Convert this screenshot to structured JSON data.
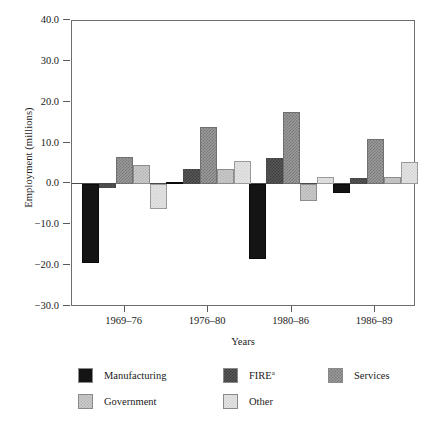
{
  "chart_data": {
    "type": "bar",
    "title": "",
    "xlabel": "Years",
    "ylabel": "Employment (millions)",
    "categories": [
      "1969–76",
      "1976–80",
      "1980–86",
      "1986–89"
    ],
    "ylim": [
      -30.0,
      40.0
    ],
    "yticks": [
      40.0,
      30.0,
      20.0,
      10.0,
      0.0,
      -10.0,
      -20.0,
      -30.0
    ],
    "ytick_labels": [
      "40.0",
      "30.0",
      "20.0",
      "10.0",
      "0.0",
      "−10.0",
      "−20.0",
      "−30.0"
    ],
    "grid": false,
    "legend_position": "below",
    "series": [
      {
        "name": "Manufacturing",
        "key": "manufacturing",
        "color": "#141414",
        "values": [
          -19.2,
          0.5,
          -18.2,
          -2.2
        ]
      },
      {
        "name": "FIRE",
        "key": "fire",
        "color": "#585858",
        "footnote": "a",
        "values": [
          -0.8,
          3.8,
          6.4,
          1.5
        ]
      },
      {
        "name": "Services",
        "key": "services",
        "color": "#9a9a9a",
        "values": [
          6.8,
          14.0,
          17.8,
          11.2
        ]
      },
      {
        "name": "Government",
        "key": "government",
        "color": "#cacaca",
        "values": [
          4.8,
          3.8,
          -4.1,
          1.9
        ]
      },
      {
        "name": "Other",
        "key": "other",
        "color": "#e4e4e4",
        "values": [
          -6.1,
          5.8,
          1.9,
          5.4
        ]
      }
    ]
  },
  "legend": {
    "rows": [
      [
        {
          "label": "Manufacturing",
          "key": "manufacturing",
          "sup": ""
        },
        {
          "label": "FIRE",
          "key": "fire",
          "sup": "a"
        },
        {
          "label": "Services",
          "key": "services",
          "sup": ""
        }
      ],
      [
        {
          "label": "Government",
          "key": "government",
          "sup": ""
        },
        {
          "label": "Other",
          "key": "other",
          "sup": ""
        }
      ]
    ]
  }
}
